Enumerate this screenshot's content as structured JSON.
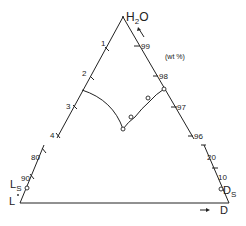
{
  "diagram": {
    "type": "ternary-phase-diagram (partial, broken sides)",
    "apex_top": {
      "label_main": "H",
      "label_sub": "2",
      "label_tail": "O"
    },
    "units_label": "(wt %)",
    "left_top_ticks": [
      "1",
      "2",
      "3",
      "4"
    ],
    "right_top_ticks": [
      "99",
      "98",
      "97",
      "96"
    ],
    "left_bottom_ticks": [
      "80",
      "90"
    ],
    "right_bottom_ticks": [
      "20",
      "10"
    ],
    "left_bottom_point": {
      "label_main": "L",
      "label_sub": "S"
    },
    "left_corner": {
      "label": "L",
      "mark": "•"
    },
    "right_bottom_point": {
      "label_main": "D",
      "label_sub": "S"
    },
    "right_corner": {
      "label": "D",
      "arrow": "→"
    },
    "line_color": "#222222",
    "background": "#ffffff"
  }
}
